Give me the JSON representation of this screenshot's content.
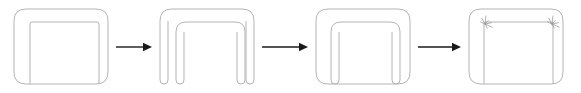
{
  "diagram": {
    "type": "process-sequence",
    "canvas": {
      "width": 581,
      "height": 93
    },
    "background_color": "#ffffff",
    "outline_color": "#b4b4b4",
    "mark_color": "#9a9a9a",
    "arrow_color": "#1a1a1a",
    "stage_count": 4,
    "arrow_count": 3,
    "stages": [
      {
        "index": 1,
        "name": "closed-frame-with-inner-panel",
        "description": "Rounded rectangle outline containing an inner rectangle open at the bottom",
        "outer": {
          "x": 14,
          "y": 9,
          "width": 94,
          "height": 75,
          "rx": 12
        },
        "inner": {
          "x": 30,
          "y": 22,
          "width": 69,
          "height": 62,
          "rx": 2
        },
        "inner_style": "open-bottom",
        "marks": []
      },
      {
        "index": 2,
        "name": "open-arch-frame",
        "description": "Inverted U arch outline with rounded leg ends and an inner arch, no bottom edge",
        "outer": {
          "x": 160,
          "y": 9,
          "width": 94,
          "height": 75,
          "rx": 12
        },
        "inner": {
          "x": 176,
          "y": 22,
          "width": 69,
          "height": 62,
          "rx": 10
        },
        "inner_style": "arch",
        "outer_style": "arch",
        "marks": []
      },
      {
        "index": 3,
        "name": "frame-with-inner-arch",
        "description": "Rounded rectangle outline containing an inner arch with rounded leg ends",
        "outer": {
          "x": 316,
          "y": 9,
          "width": 94,
          "height": 75,
          "rx": 12
        },
        "inner": {
          "x": 331,
          "y": 22,
          "width": 69,
          "height": 62,
          "rx": 10
        },
        "inner_style": "arch",
        "marks": []
      },
      {
        "index": 4,
        "name": "fastened-frame-with-corner-marks",
        "description": "Rounded rectangle outline with inner rectangle and starburst fastening marks at both upper inner corners",
        "outer": {
          "x": 469,
          "y": 9,
          "width": 94,
          "height": 75,
          "rx": 12
        },
        "inner": {
          "x": 484,
          "y": 22,
          "width": 69,
          "height": 62,
          "rx": 2
        },
        "inner_style": "open-bottom",
        "marks": [
          {
            "name": "corner-burst-left",
            "cx": 485,
            "cy": 24,
            "radius": 8,
            "rays": 7
          },
          {
            "name": "corner-burst-right",
            "cx": 552,
            "cy": 24,
            "radius": 8,
            "rays": 7
          }
        ]
      }
    ],
    "arrows": [
      {
        "index": 1,
        "name": "arrow-stage1-to-stage2",
        "x1": 116,
        "y1": 47,
        "x2": 152,
        "y2": 47,
        "direction": "right"
      },
      {
        "index": 2,
        "name": "arrow-stage2-to-stage3",
        "x1": 262,
        "y1": 47,
        "x2": 308,
        "y2": 47,
        "direction": "right"
      },
      {
        "index": 3,
        "name": "arrow-stage3-to-stage4",
        "x1": 418,
        "y1": 47,
        "x2": 461,
        "y2": 47,
        "direction": "right"
      }
    ]
  }
}
